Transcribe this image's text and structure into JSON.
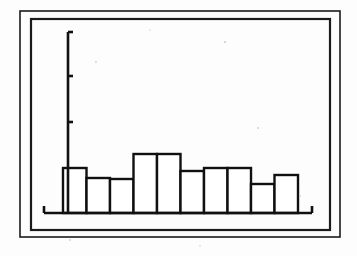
{
  "figure": {
    "kind": "histogram-figure",
    "title": "",
    "subtitle": "",
    "background_color": "#fdfdfd",
    "ink_color": "#111111",
    "bar_fill_color": "#ffffff",
    "bar_stroke_color": "#101010",
    "frame": {
      "name": "double-rule-border",
      "outer": {
        "x": 20,
        "y": 11,
        "width": 320,
        "height": 226,
        "stroke_width": 1.6
      },
      "inner": {
        "x": 31,
        "y": 19,
        "width": 299,
        "height": 211,
        "stroke_width": 2.2
      }
    }
  },
  "plot": {
    "baseline_y": 213,
    "axis_x": 68,
    "x_axis_start": 44,
    "x_axis_end": 312,
    "y_axis_top": 32,
    "axis_stroke_width": 2.6,
    "endcap_length": 7,
    "tick_length": 5,
    "bar_origin_x": 63,
    "bar_width": 23.5,
    "bar_stroke_width": 2.4
  },
  "chart_data": {
    "type": "bar",
    "title": "",
    "subtitle": "",
    "xlabel": "",
    "ylabel": "",
    "legend": [],
    "legend_position": "none",
    "grid": false,
    "orientation": "vertical",
    "bar_style": "outlined-adjacent-histogram",
    "categories": [
      "1",
      "2",
      "3",
      "4",
      "5",
      "6",
      "7",
      "8",
      "9",
      "10"
    ],
    "tick_labels_x": [],
    "tick_labels_y": [],
    "xlim": [
      0,
      10
    ],
    "ylim": [
      0,
      181
    ],
    "values": [
      45,
      35,
      34,
      59,
      59,
      42,
      45,
      45,
      29,
      38
    ],
    "bar_top_pixel_y": [
      168,
      178,
      179,
      154,
      154,
      171,
      168,
      168,
      184,
      175
    ],
    "y_axis_ticks_pixel_y": [
      32,
      76,
      122
    ],
    "annotations": []
  },
  "speckles": [
    {
      "x": 225,
      "y": 42,
      "r": 1.1
    },
    {
      "x": 258,
      "y": 128,
      "r": 1.0
    },
    {
      "x": 96,
      "y": 62,
      "r": 0.9
    },
    {
      "x": 300,
      "y": 196,
      "r": 0.9
    },
    {
      "x": 150,
      "y": 30,
      "r": 0.8
    },
    {
      "x": 70,
      "y": 240,
      "r": 0.9
    },
    {
      "x": 200,
      "y": 246,
      "r": 0.8
    }
  ]
}
